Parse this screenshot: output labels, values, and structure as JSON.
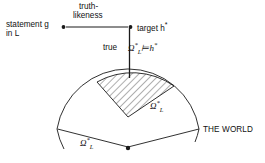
{
  "figure": {
    "background_color": "#ffffff",
    "line_color": "#1a1a1a"
  },
  "labels": {
    "statement": "statement g",
    "statement_lang": "in L",
    "truthlikeness_line1": "truth-",
    "truthlikeness_line2": "likeness",
    "target": "target h",
    "target_star": "*",
    "true": "true",
    "entailment_omega": "Ω",
    "entailment_star": "*",
    "entailment_sub": "L",
    "entailment_turnstile": "⊨",
    "entailment_h": "h",
    "entailment_h_star": "*",
    "omega_inner": "Ω",
    "omega_inner_star": "*",
    "omega_inner_sub": "L",
    "omega_outer": "Ω",
    "omega_outer_star": "*",
    "omega_outer_sub": "L",
    "the_world": "THE WORLD"
  },
  "geometry": {
    "apex_x": 128,
    "apex_y": 148,
    "outer_radius": 72,
    "inner_apex_y": 117,
    "left_edge_x": 64,
    "left_edge_y": 124,
    "right_edge_x": 193,
    "right_edge_y": 126,
    "vertical_line_top_y": 27,
    "vertical_line_bottom_y": 78,
    "statement_dot_x": 63,
    "statement_dot_y": 27,
    "target_dot_x": 130,
    "target_dot_y": 27
  }
}
